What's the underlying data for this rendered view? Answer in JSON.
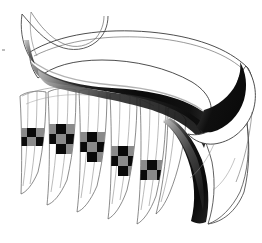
{
  "artwork": {
    "title": "Abstract Ribbon Scroll",
    "medium": "pen-and-ink line drawing with grayscale wash",
    "background_color": "#ffffff",
    "canvas": {
      "width": 262,
      "height": 243
    },
    "palette": {
      "ink_line": "#3a3a3a",
      "fine_line": "#555555",
      "black_fill": "#0a0a0a",
      "dark_gray": "#3d3d3d",
      "mid_gray": "#8a8a8a",
      "light_gray": "#c4c4c4",
      "paper_white": "#ffffff"
    },
    "elements": [
      {
        "name": "top-curl-hook",
        "description": "thin hook-shaped curl at upper left, drawn with fine tapering lines",
        "region": "x 18-75, y 8-60",
        "fill": "#ffffff",
        "stroke": "#555555"
      },
      {
        "name": "main-ribbon-sweep",
        "description": "broad ribbon sweeping left to right across the top, white upper face",
        "region": "x 22-250, y 20-120",
        "fill": "#ffffff",
        "stroke": "#3a3a3a"
      },
      {
        "name": "ribbon-shaded-underside",
        "description": "heavy dark band shading the underside of the ribbon, gradient from gray to black",
        "region": "x 28-235, y 55-120",
        "fill": "#0a0a0a"
      },
      {
        "name": "ribbon-right-turn",
        "description": "ribbon curving down and back at the right edge forming an open loop",
        "region": "x 180-255, y 60-200",
        "fill": "#ffffff",
        "stroke": "#3a3a3a"
      },
      {
        "name": "fringe-strips",
        "description": "series of tapering vertical strips hanging below the ribbon, ending in pointed tips",
        "count": 8,
        "region": "x 18-190, y 85-225",
        "fill": "#ffffff",
        "stroke": "#555555"
      },
      {
        "name": "checkerboard-bands",
        "description": "checkered squares of black and mid-gray crossing the fringe strips in a descending diagonal",
        "count": 5,
        "region": "x 35-175, y 118-190",
        "colors": [
          "#0a0a0a",
          "#8a8a8a"
        ]
      },
      {
        "name": "lower-right-flourish",
        "description": "large flowing form at lower right with thick black diagonal band and gray gradient edge",
        "region": "x 150-250, y 110-225",
        "fill": "#ffffff",
        "stroke": "#3a3a3a"
      }
    ]
  }
}
